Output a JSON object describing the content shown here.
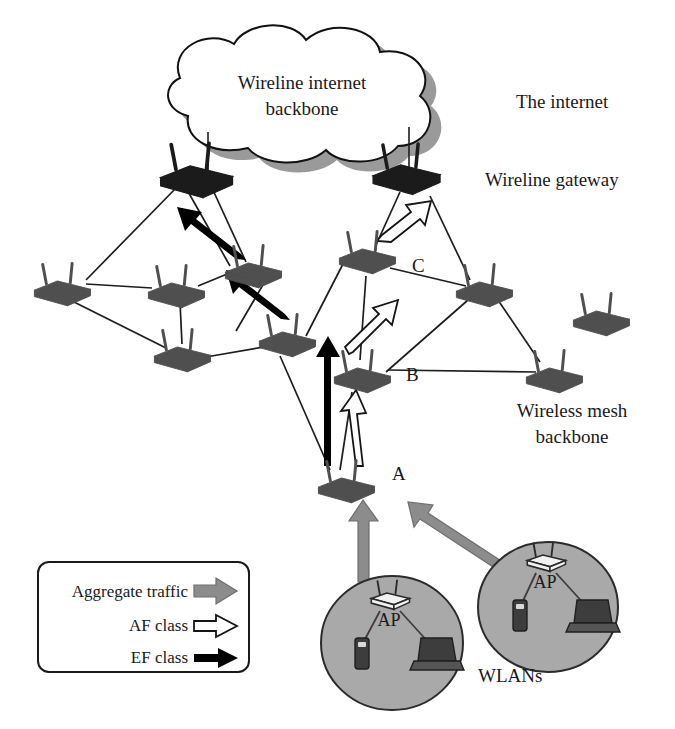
{
  "figure": {
    "type": "network-architecture-diagram",
    "title_visible": false,
    "background_color": "#ffffff"
  },
  "cloud": {
    "label_line1": "Wireline internet",
    "label_line2": "backbone",
    "fill": "#ffffff",
    "stroke": "#111111",
    "shadow_color": "#9a9a9a",
    "center": {
      "x": 302,
      "y": 96
    },
    "rx": 145,
    "ry": 58
  },
  "annotations": {
    "the_internet": "The internet",
    "wireline_gateway": "Wireline gateway",
    "wireless_mesh_line1": "Wireless mesh",
    "wireless_mesh_line2": "backbone",
    "wlans": "WLANs"
  },
  "colors": {
    "gateway_router": "#1b1b1b",
    "mesh_router": "#4f4f4f",
    "ap_router": "#f2f2f2",
    "wlan_ellipse_fill": "#a9a9a9",
    "wlan_ellipse_stroke": "#2b2b2b",
    "link_line": "#1d1d1d",
    "aggregate_arrow": "#8c8c8c",
    "af_arrow_fill": "#ffffff",
    "af_arrow_stroke": "#151515",
    "ef_arrow": "#000000",
    "device_dark": "#3d3d3d",
    "text": "#1a1a1a"
  },
  "gateways": [
    {
      "id": "gw-left",
      "x": 196,
      "y": 180,
      "label": ""
    },
    {
      "id": "gw-right",
      "x": 406,
      "y": 178,
      "label": ""
    }
  ],
  "mesh_nodes": [
    {
      "id": "m1",
      "x": 62,
      "y": 290,
      "label": ""
    },
    {
      "id": "m2",
      "x": 176,
      "y": 292,
      "label": ""
    },
    {
      "id": "m3",
      "x": 253,
      "y": 272,
      "label": ""
    },
    {
      "id": "m4",
      "x": 182,
      "y": 356,
      "label": ""
    },
    {
      "id": "m5",
      "x": 287,
      "y": 341,
      "label": ""
    },
    {
      "id": "nodeC",
      "x": 367,
      "y": 258,
      "label": "C",
      "label_x": 412,
      "label_y": 272
    },
    {
      "id": "m7",
      "x": 484,
      "y": 291,
      "label": ""
    },
    {
      "id": "m8",
      "x": 601,
      "y": 320,
      "label": ""
    },
    {
      "id": "nodeB",
      "x": 362,
      "y": 377,
      "label": "B",
      "label_x": 406,
      "label_y": 381
    },
    {
      "id": "m9",
      "x": 554,
      "y": 377,
      "label": ""
    },
    {
      "id": "nodeA",
      "x": 346,
      "y": 487,
      "label": "A",
      "label_x": 392,
      "label_y": 480
    }
  ],
  "mesh_links": [
    {
      "from": "gw-left",
      "to": "m2"
    },
    {
      "from": "gw-left",
      "to": "m1"
    },
    {
      "from": "gw-left",
      "to": "m3"
    },
    {
      "from": "m1",
      "to": "m2"
    },
    {
      "from": "m1",
      "to": "m4"
    },
    {
      "from": "m2",
      "to": "m3"
    },
    {
      "from": "m2",
      "to": "m4"
    },
    {
      "from": "m4",
      "to": "m5"
    },
    {
      "from": "m3",
      "to": "m5"
    },
    {
      "from": "nodeC",
      "to": "gw-right"
    },
    {
      "from": "nodeC",
      "to": "m5"
    },
    {
      "from": "nodeC",
      "to": "m7"
    },
    {
      "from": "nodeC",
      "to": "nodeB"
    },
    {
      "from": "m7",
      "to": "nodeB"
    },
    {
      "from": "m9",
      "to": "nodeB"
    },
    {
      "from": "nodeB",
      "to": "nodeA"
    },
    {
      "from": "m5",
      "to": "nodeA"
    }
  ],
  "traffic_flows": [
    {
      "class": "EF class",
      "style": "solid-black",
      "from": "nodeA",
      "to": "m5"
    },
    {
      "class": "EF class",
      "style": "solid-black",
      "from": "m5",
      "to": "m3"
    },
    {
      "class": "EF class",
      "style": "solid-black",
      "from": "m3",
      "to": "gw-left"
    },
    {
      "class": "AF class",
      "style": "hollow-white",
      "from": "nodeA",
      "to": "nodeB"
    },
    {
      "class": "AF class",
      "style": "hollow-white",
      "from": "nodeB",
      "to": "nodeC"
    },
    {
      "class": "AF class",
      "style": "hollow-white",
      "from": "nodeC",
      "to": "gw-right"
    },
    {
      "class": "Aggregate traffic",
      "style": "thick-gray",
      "from": "wlan-left",
      "to": "nodeA"
    },
    {
      "class": "Aggregate traffic",
      "style": "thick-gray",
      "from": "wlan-right",
      "to": "nodeA"
    }
  ],
  "wlans": [
    {
      "id": "wlan-left",
      "cx": 392,
      "cy": 643,
      "rx": 71,
      "ry": 67,
      "ap_label": "AP",
      "devices": [
        "access-point",
        "mobile-phone",
        "laptop"
      ]
    },
    {
      "id": "wlan-right",
      "cx": 548,
      "cy": 607,
      "rx": 70,
      "ry": 65,
      "ap_label": "AP",
      "devices": [
        "access-point",
        "mobile-phone",
        "laptop"
      ]
    }
  ],
  "legend": {
    "box": {
      "x": 38,
      "y": 562,
      "width": 211,
      "height": 110
    },
    "entries": [
      {
        "label": "Aggregate traffic",
        "arrow": "thick-gray-arrow",
        "color": "#8c8c8c"
      },
      {
        "label": "AF class",
        "arrow": "hollow-white-arrow",
        "color": "#ffffff"
      },
      {
        "label": "EF class",
        "arrow": "solid-black-arrow",
        "color": "#000000"
      }
    ]
  }
}
